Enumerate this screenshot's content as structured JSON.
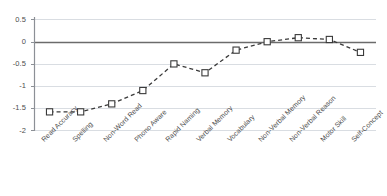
{
  "chart_data": {
    "type": "line",
    "title": "",
    "subtitle": "",
    "xlabel": "",
    "ylabel": "",
    "categories": [
      "Read Accuracy",
      "Spelling",
      "Non-Word Read",
      "Phono Aware",
      "Rapid Naming",
      "Verbal Memory",
      "Vocabulary",
      "Non-Verbal Memory",
      "Non-Verbal Reason",
      "Motor Skill",
      "Self-Concept"
    ],
    "values": [
      -1.58,
      -1.58,
      -1.4,
      -1.1,
      -0.5,
      -0.7,
      -0.19,
      0.0,
      0.09,
      0.05,
      -0.24
    ],
    "series": [
      {
        "name": "Effect size",
        "values": [
          -1.58,
          -1.58,
          -1.4,
          -1.1,
          -0.5,
          -0.7,
          -0.19,
          0.0,
          0.09,
          0.05,
          -0.24
        ]
      }
    ],
    "ylim": [
      -2,
      0.5
    ],
    "yticks": [
      0.5,
      0,
      -0.5,
      -1,
      -1.5,
      -2
    ],
    "ytick_labels": [
      "0.5",
      "0",
      "-0.5",
      "-1",
      "-1.5",
      "-2"
    ],
    "grid": true,
    "grid_axis": "y",
    "legend": "none",
    "line_style": "dashed",
    "marker": "open-square",
    "colors": {
      "line": "#3a3a3a",
      "marker_face": "#ffffff",
      "marker_edge": "#3a3a3a",
      "grid": "#d9dde2",
      "zero_line": "#6b6b6b",
      "axis": "#8c9096",
      "background": "#ffffff",
      "tick_text": "#4d4d4d"
    }
  }
}
